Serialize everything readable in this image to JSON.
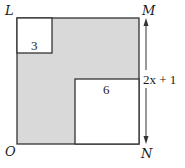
{
  "diagram": {
    "vertices": {
      "top_left": "L",
      "top_right": "M",
      "bottom_left": "O",
      "bottom_right": "N"
    },
    "small_square_label": "3",
    "large_square_label": "6",
    "side_length_label": "2x + 1",
    "colors": {
      "shaded": "#d9d9d9",
      "stroke": "#333333",
      "background": "#ffffff"
    }
  }
}
